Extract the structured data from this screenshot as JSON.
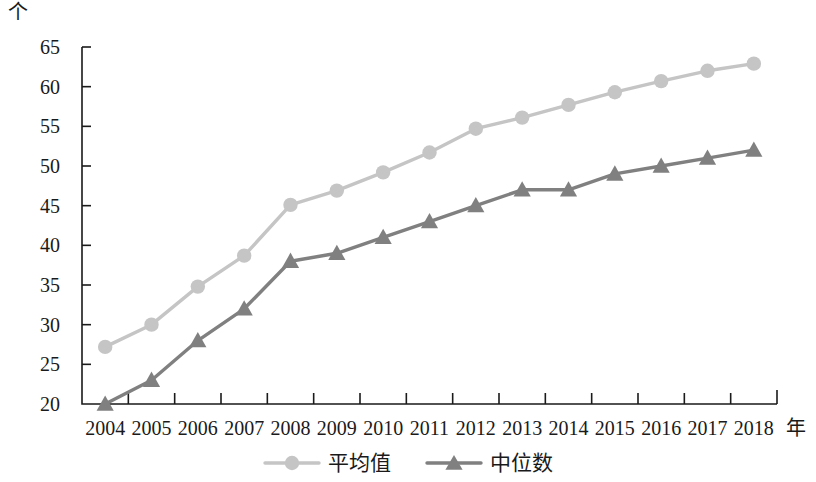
{
  "axes": {
    "unit_label": "个",
    "x_axis_title": "年",
    "y_ticks": [
      "65",
      "60",
      "55",
      "50",
      "45",
      "40",
      "35",
      "30",
      "25",
      "20"
    ],
    "x_ticks": [
      "2004",
      "2005",
      "2006",
      "2007",
      "2008",
      "2009",
      "2010",
      "2011",
      "2012",
      "2013",
      "2014",
      "2015",
      "2016",
      "2017",
      "2018"
    ]
  },
  "legend": {
    "items": [
      {
        "label": "平均值",
        "marker": "circle-marker-icon",
        "color": "#c5c5c5"
      },
      {
        "label": "中位数",
        "marker": "triangle-marker-icon",
        "color": "#808080"
      }
    ]
  },
  "colors": {
    "mean_series": "#c5c5c5",
    "median_series": "#808080",
    "axis": "#1a1a1a",
    "background": "#ffffff"
  },
  "chart_data": {
    "type": "line",
    "title": "",
    "subtitle": "",
    "xlabel": "年",
    "ylabel": "个",
    "grid": false,
    "legend_position": "bottom",
    "xlim": [
      2004,
      2018
    ],
    "ylim": [
      20,
      65
    ],
    "ytick_step": 5,
    "categories": [
      "2004",
      "2005",
      "2006",
      "2007",
      "2008",
      "2009",
      "2010",
      "2011",
      "2012",
      "2013",
      "2014",
      "2015",
      "2016",
      "2017",
      "2018"
    ],
    "series": [
      {
        "name": "平均值",
        "marker": "circle",
        "color": "#c5c5c5",
        "values": [
          27.2,
          30.0,
          34.8,
          38.7,
          45.1,
          46.9,
          49.2,
          51.7,
          54.7,
          56.1,
          57.7,
          59.3,
          60.7,
          62.0,
          62.9
        ]
      },
      {
        "name": "中位数",
        "marker": "triangle",
        "color": "#808080",
        "values": [
          20.0,
          23.0,
          28.0,
          32.0,
          38.0,
          39.0,
          41.0,
          43.0,
          45.0,
          47.0,
          47.0,
          49.0,
          50.0,
          51.0,
          52.0
        ]
      }
    ]
  }
}
